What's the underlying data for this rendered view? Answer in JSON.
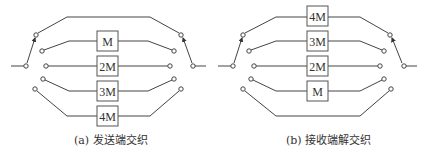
{
  "diagrams": [
    {
      "id": "a",
      "caption": "(a) 发送端交织",
      "boxes": [
        "M",
        "2M",
        "3M",
        "4M"
      ],
      "top_branch": "bypass",
      "bottom_branch": "4M"
    },
    {
      "id": "b",
      "caption": "(b) 接收端解交织",
      "boxes": [
        "4M",
        "3M",
        "2M",
        "M"
      ],
      "top_branch": "4M",
      "bottom_branch": "bypass"
    }
  ],
  "colors": {
    "line": "#444444",
    "box_stroke": "#555555",
    "text": "#333333"
  }
}
